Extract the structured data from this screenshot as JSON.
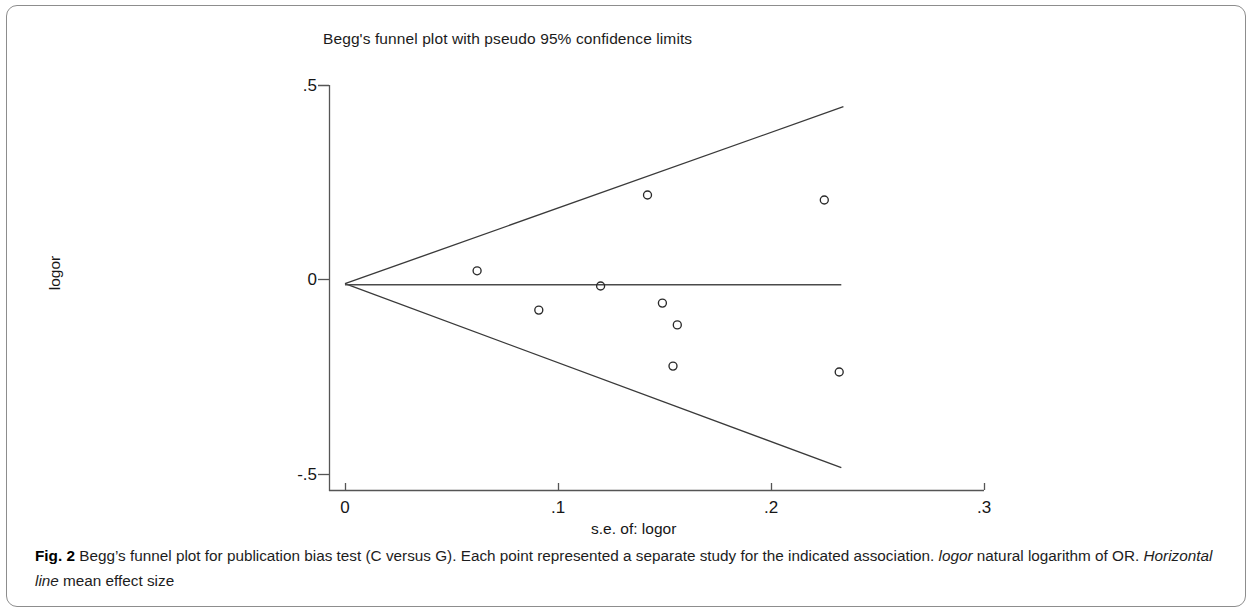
{
  "figure": {
    "chart_title": "Begg's funnel plot with pseudo 95% confidence limits",
    "caption_label": "Fig. 2",
    "caption_part1": " Begg’s funnel plot for publication bias test (C versus G). Each point represented a separate study for the indicated association. ",
    "caption_italic1": "logor",
    "caption_part2": " natural logarithm of OR. ",
    "caption_italic2": "Horizontal line",
    "caption_part3": " mean effect size"
  },
  "axes": {
    "y_ticks": [
      ".5",
      "0",
      "-.5"
    ],
    "x_ticks": [
      "0",
      ".1",
      ".2",
      ".3"
    ],
    "y_title": "logor",
    "x_title": "s.e. of: logor"
  },
  "chart_data": {
    "type": "scatter",
    "title": "Begg's funnel plot with pseudo 95% confidence limits",
    "xlabel": "s.e. of: logor",
    "ylabel": "logor",
    "xlim": [
      0,
      0.3
    ],
    "ylim": [
      -0.5,
      0.5
    ],
    "xticks": [
      0,
      0.1,
      0.2,
      0.3
    ],
    "yticks": [
      -0.5,
      0,
      0.5
    ],
    "grid": false,
    "legend": false,
    "series": [
      {
        "name": "studies",
        "marker": "open-circle",
        "x": [
          0.062,
          0.091,
          0.12,
          0.142,
          0.149,
          0.154,
          0.156,
          0.225,
          0.232
        ],
        "y": [
          0.021,
          -0.08,
          -0.018,
          0.216,
          -0.062,
          -0.224,
          -0.118,
          0.203,
          -0.239
        ]
      }
    ],
    "reference_lines": [
      {
        "name": "mean-effect-size",
        "type": "horizontal",
        "y": -0.015,
        "x_from": 0.0,
        "x_to": 0.233
      },
      {
        "name": "pseudo-95-upper-limit",
        "type": "funnel-upper",
        "x_from": 0.0,
        "y_from": -0.012,
        "x_to": 0.234,
        "y_to": 0.443
      },
      {
        "name": "pseudo-95-lower-limit",
        "type": "funnel-lower",
        "x_from": 0.0,
        "y_from": -0.012,
        "x_to": 0.233,
        "y_to": -0.485
      }
    ]
  }
}
